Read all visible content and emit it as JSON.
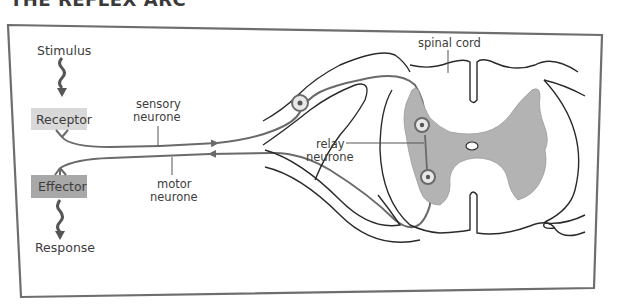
{
  "title": "THE REFLEX ARC",
  "labels": {
    "stimulus": "Stimulus",
    "receptor": "Receptor",
    "effector": "Effector",
    "response": "Response",
    "sensory_1": "sensory",
    "sensory_2": "neurone",
    "motor_1": "motor",
    "motor_2": "neurone",
    "relay_1": "relay",
    "relay_2": "neurone",
    "spinal_cord": "spinal cord"
  },
  "colors": {
    "frame": "#6e6e6e",
    "outline": "#2a2a2a",
    "neurone": "#6a6a6a",
    "grey_matter": "#b3b3b3",
    "receptor_box": "#d9d9d9",
    "effector_box": "#a8a8a8",
    "text": "#3c3c3c"
  }
}
